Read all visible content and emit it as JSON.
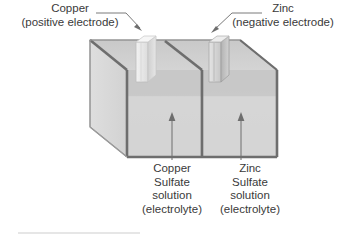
{
  "figure": {
    "type": "galvanic-cell-diagram",
    "background_color": "#ffffff",
    "text_color": "#3a3a3a",
    "outline_color": "#6b6b6b",
    "tank_glass_color": "#d8d8d8",
    "electrolyte_color": "#cfcfcf"
  },
  "callouts": {
    "copper": {
      "line1": "Copper",
      "line2": "(positive electrode)"
    },
    "zinc": {
      "line1": "Zinc",
      "line2": "(negative electrode)"
    }
  },
  "solutions": {
    "copper_sulfate": {
      "line1": "Copper",
      "line2": "Sulfate",
      "line3": "solution",
      "line4": "(electrolyte)"
    },
    "zinc_sulfate": {
      "line1": "Zinc",
      "line2": "Sulfate",
      "line3": "solution",
      "line4": "(electrolyte)"
    }
  }
}
